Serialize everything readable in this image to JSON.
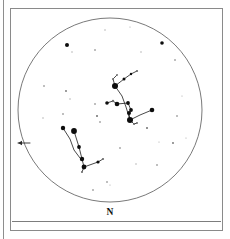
{
  "chart_data": {
    "type": "scatter",
    "title": "",
    "subtitle": "",
    "xlabel": "",
    "ylabel": "",
    "projection": "circular all-sky horizon chart",
    "grid": false,
    "legend": null,
    "horizon": {
      "center_x": 110,
      "center_y": 110,
      "radius": 92
    },
    "direction_labels": [
      {
        "id": "north",
        "text": "N",
        "x": 110,
        "y": 213
      }
    ],
    "direction_arrows": [
      {
        "id": "west-arrow",
        "x1": 30,
        "y1": 143,
        "x2": 18,
        "y2": 143,
        "points": "left"
      }
    ],
    "constellation_lines": [
      {
        "name": "orion-belt-to-betelgeuse",
        "points": [
          [
            130,
            120
          ],
          [
            126,
            107
          ],
          [
            122,
            96
          ],
          [
            115,
            86
          ]
        ]
      },
      {
        "name": "orion-shoulder-arc",
        "points": [
          [
            115,
            86
          ],
          [
            124,
            79
          ],
          [
            131,
            74
          ],
          [
            137,
            71
          ]
        ]
      },
      {
        "name": "orion-upper-branch",
        "points": [
          [
            115,
            86
          ],
          [
            113,
            79
          ],
          [
            117,
            75
          ]
        ]
      },
      {
        "name": "orion-belt-to-rigel",
        "points": [
          [
            130,
            120
          ],
          [
            129,
            113
          ],
          [
            131,
            110
          ],
          [
            128,
            103
          ],
          [
            117,
            104
          ]
        ]
      },
      {
        "name": "orion-belt-to-saiph",
        "points": [
          [
            130,
            120
          ],
          [
            140,
            115
          ],
          [
            152,
            110
          ]
        ]
      },
      {
        "name": "orion-club",
        "points": [
          [
            130,
            120
          ],
          [
            134,
            124
          ],
          [
            137,
            123
          ]
        ]
      },
      {
        "name": "orion-lower-left",
        "points": [
          [
            117,
            104
          ],
          [
            113,
            101
          ],
          [
            107,
            103
          ]
        ]
      },
      {
        "name": "taurus-horn",
        "points": [
          [
            74,
            131
          ],
          [
            79,
            147
          ],
          [
            82,
            159
          ],
          [
            84,
            167
          ]
        ]
      },
      {
        "name": "taurus-hyades",
        "points": [
          [
            84,
            167
          ],
          [
            98,
            162
          ],
          [
            103,
            159
          ]
        ]
      },
      {
        "name": "taurus-lower",
        "points": [
          [
            84,
            167
          ],
          [
            82,
            172
          ]
        ]
      },
      {
        "name": "aldebaran-chain",
        "points": [
          [
            63,
            128
          ],
          [
            70,
            139
          ],
          [
            74,
            150
          ],
          [
            80,
            158
          ]
        ]
      }
    ],
    "stars": [
      {
        "id": "betelgeuse",
        "x": 115,
        "y": 86,
        "mag": 0.5,
        "r": 3.0
      },
      {
        "id": "rigel",
        "x": 130,
        "y": 120,
        "mag": 0.1,
        "r": 3.0
      },
      {
        "id": "bellatrix",
        "x": 117,
        "y": 104,
        "mag": 1.6,
        "r": 2.3
      },
      {
        "id": "alnitak",
        "x": 129,
        "y": 113,
        "mag": 1.8,
        "r": 2.0
      },
      {
        "id": "alnilam",
        "x": 131,
        "y": 110,
        "mag": 1.7,
        "r": 1.9
      },
      {
        "id": "mintaka",
        "x": 128,
        "y": 103,
        "mag": 2.2,
        "r": 1.9
      },
      {
        "id": "saiph",
        "x": 152,
        "y": 110,
        "mag": 2.1,
        "r": 2.3
      },
      {
        "id": "meissa",
        "x": 124,
        "y": 79,
        "mag": 3.4,
        "r": 1.5
      },
      {
        "id": "orion-arc-2",
        "x": 131,
        "y": 74,
        "mag": 3.8,
        "r": 1.2
      },
      {
        "id": "orion-arc-3",
        "x": 137,
        "y": 71,
        "mag": 4.0,
        "r": 1.1
      },
      {
        "id": "orion-upper-a",
        "x": 113,
        "y": 79,
        "mag": 4.2,
        "r": 1.0
      },
      {
        "id": "orion-upper-b",
        "x": 117,
        "y": 75,
        "mag": 4.3,
        "r": 0.9
      },
      {
        "id": "orion-club-a",
        "x": 134,
        "y": 124,
        "mag": 4.0,
        "r": 1.1
      },
      {
        "id": "orion-club-b",
        "x": 137,
        "y": 123,
        "mag": 4.4,
        "r": 0.9
      },
      {
        "id": "orion-west-a",
        "x": 113,
        "y": 101,
        "mag": 3.9,
        "r": 1.2
      },
      {
        "id": "orion-west-b",
        "x": 107,
        "y": 103,
        "mag": 3.2,
        "r": 1.8
      },
      {
        "id": "aldebaran",
        "x": 74,
        "y": 131,
        "mag": 0.9,
        "r": 2.9
      },
      {
        "id": "taurus-b",
        "x": 79,
        "y": 147,
        "mag": 3.0,
        "r": 1.9
      },
      {
        "id": "taurus-c",
        "x": 82,
        "y": 159,
        "mag": 2.9,
        "r": 2.2
      },
      {
        "id": "taurus-d",
        "x": 84,
        "y": 167,
        "mag": 2.6,
        "r": 2.4
      },
      {
        "id": "taurus-e",
        "x": 98,
        "y": 162,
        "mag": 3.5,
        "r": 1.6
      },
      {
        "id": "taurus-f",
        "x": 103,
        "y": 159,
        "mag": 4.0,
        "r": 1.1
      },
      {
        "id": "taurus-g",
        "x": 63,
        "y": 128,
        "mag": 2.8,
        "r": 2.2
      },
      {
        "id": "field-n1",
        "x": 67,
        "y": 45,
        "mag": 3.1,
        "r": 2.0
      },
      {
        "id": "field-n2",
        "x": 162,
        "y": 43,
        "mag": 3.3,
        "r": 1.8
      },
      {
        "id": "field-n3",
        "x": 95,
        "y": 50,
        "mag": 4.6,
        "r": 0.8
      },
      {
        "id": "field-n4",
        "x": 105,
        "y": 30,
        "mag": 4.8,
        "r": 0.7
      },
      {
        "id": "field-n5",
        "x": 130,
        "y": 27,
        "mag": 4.9,
        "r": 0.6
      },
      {
        "id": "field-n6",
        "x": 72,
        "y": 52,
        "mag": 4.8,
        "r": 0.7
      },
      {
        "id": "field-n7",
        "x": 141,
        "y": 52,
        "mag": 4.7,
        "r": 0.7
      },
      {
        "id": "field-n8",
        "x": 175,
        "y": 60,
        "mag": 4.5,
        "r": 0.8
      },
      {
        "id": "field-w1",
        "x": 44,
        "y": 86,
        "mag": 4.6,
        "r": 0.8
      },
      {
        "id": "field-w2",
        "x": 66,
        "y": 91,
        "mag": 4.4,
        "r": 0.9
      },
      {
        "id": "field-w3",
        "x": 70,
        "y": 99,
        "mag": 4.7,
        "r": 0.7
      },
      {
        "id": "field-w4",
        "x": 63,
        "y": 114,
        "mag": 4.5,
        "r": 0.8
      },
      {
        "id": "field-w5",
        "x": 43,
        "y": 118,
        "mag": 4.8,
        "r": 0.7
      },
      {
        "id": "field-w6",
        "x": 97,
        "y": 116,
        "mag": 4.3,
        "r": 1.0
      },
      {
        "id": "field-w7",
        "x": 95,
        "y": 104,
        "mag": 4.6,
        "r": 0.8
      },
      {
        "id": "field-c1",
        "x": 100,
        "y": 122,
        "mag": 4.6,
        "r": 0.8
      },
      {
        "id": "field-e1",
        "x": 177,
        "y": 116,
        "mag": 4.5,
        "r": 0.8
      },
      {
        "id": "field-e2",
        "x": 173,
        "y": 143,
        "mag": 4.4,
        "r": 0.9
      },
      {
        "id": "field-e3",
        "x": 159,
        "y": 142,
        "mag": 4.8,
        "r": 0.6
      },
      {
        "id": "field-e4",
        "x": 186,
        "y": 138,
        "mag": 4.9,
        "r": 0.6
      },
      {
        "id": "field-e5",
        "x": 157,
        "y": 165,
        "mag": 4.6,
        "r": 0.8
      },
      {
        "id": "field-e6",
        "x": 182,
        "y": 96,
        "mag": 4.8,
        "r": 0.6
      },
      {
        "id": "field-s1",
        "x": 107,
        "y": 182,
        "mag": 4.6,
        "r": 0.8
      },
      {
        "id": "field-s2",
        "x": 110,
        "y": 185,
        "mag": 4.8,
        "r": 0.6
      },
      {
        "id": "field-s3",
        "x": 93,
        "y": 190,
        "mag": 4.5,
        "r": 0.8
      },
      {
        "id": "field-s4",
        "x": 136,
        "y": 164,
        "mag": 4.7,
        "r": 0.7
      },
      {
        "id": "field-s5",
        "x": 120,
        "y": 148,
        "mag": 4.6,
        "r": 0.8
      },
      {
        "id": "field-s6",
        "x": 82,
        "y": 172,
        "mag": 4.3,
        "r": 1.0
      },
      {
        "id": "field-s7",
        "x": 147,
        "y": 128,
        "mag": 4.2,
        "r": 1.0
      }
    ]
  },
  "frame": {
    "left_rule_x": 3,
    "box": {
      "x": 10,
      "y": 8,
      "w": 213,
      "h": 223
    }
  }
}
